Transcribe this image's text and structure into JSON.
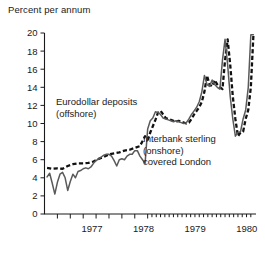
{
  "chart_data": {
    "type": "line",
    "title": "Percent per annum",
    "xlabel": "",
    "ylabel": "Percent per annum",
    "ylim": [
      0,
      20
    ],
    "ytick_step": 2,
    "yticks": [
      0,
      2,
      4,
      6,
      8,
      10,
      12,
      14,
      16,
      18,
      20
    ],
    "xlim": [
      1976.5,
      1980.6
    ],
    "xticks": [
      1977,
      1978,
      1979,
      1980
    ],
    "xtick_labels": [
      "1977",
      "1978",
      "1979",
      "1980"
    ],
    "grid": false,
    "legend_position": "inline-annotations",
    "annotations": [
      {
        "name": "eurodollar-annotation",
        "lines": [
          "Eurodollar deposits",
          "(offshore)"
        ],
        "x": 56,
        "y": 105
      },
      {
        "name": "interbank-annotation",
        "lines": [
          "Interbank sterling",
          "(onshore)",
          "covered London"
        ],
        "x": 143,
        "y": 142
      }
    ],
    "series": [
      {
        "name": "Eurodollar deposits (offshore)",
        "style": "dashed",
        "color": "#111111",
        "x": [
          1976.55,
          1976.65,
          1976.75,
          1976.85,
          1976.95,
          1977.05,
          1977.15,
          1977.25,
          1977.35,
          1977.45,
          1977.55,
          1977.65,
          1977.75,
          1977.85,
          1977.95,
          1978.05,
          1978.15,
          1978.25,
          1978.35,
          1978.45,
          1978.5,
          1978.55,
          1978.6,
          1978.65,
          1978.7,
          1978.75,
          1978.8,
          1978.85,
          1978.9,
          1978.95,
          1979.0,
          1979.05,
          1979.1,
          1979.15,
          1979.2,
          1979.25,
          1979.3,
          1979.35,
          1979.4,
          1979.45,
          1979.5,
          1979.55,
          1979.6,
          1979.65,
          1979.7,
          1979.75,
          1979.8,
          1979.85,
          1979.9,
          1979.95,
          1980.0,
          1980.05,
          1980.1,
          1980.15,
          1980.2,
          1980.25,
          1980.3,
          1980.35,
          1980.4,
          1980.45,
          1980.5,
          1980.55
        ],
        "values": [
          5.1,
          5.0,
          5.05,
          5.0,
          5.3,
          5.5,
          5.6,
          5.6,
          5.65,
          5.8,
          6.1,
          6.3,
          6.6,
          6.7,
          6.8,
          7.0,
          7.1,
          7.3,
          7.5,
          8.6,
          8.2,
          9.0,
          9.7,
          10.4,
          11.2,
          11.4,
          11.0,
          10.6,
          10.5,
          10.4,
          10.3,
          10.2,
          10.3,
          10.2,
          10.1,
          10.0,
          10.1,
          10.5,
          11.0,
          11.4,
          11.8,
          12.4,
          13.5,
          15.3,
          14.3,
          14.1,
          14.8,
          14.3,
          14.0,
          13.8,
          17.0,
          19.3,
          16.5,
          13.0,
          10.5,
          8.6,
          9.0,
          9.1,
          10.5,
          11.5,
          14.0,
          19.8
        ]
      },
      {
        "name": "Interbank sterling (onshore) covered London",
        "style": "solid",
        "color": "#5a5a5a",
        "x": [
          1976.55,
          1976.6,
          1976.65,
          1976.7,
          1976.75,
          1976.8,
          1976.85,
          1976.9,
          1976.95,
          1977.0,
          1977.05,
          1977.1,
          1977.15,
          1977.2,
          1977.25,
          1977.3,
          1977.35,
          1977.4,
          1977.45,
          1977.5,
          1977.55,
          1977.6,
          1977.65,
          1977.7,
          1977.75,
          1977.8,
          1977.85,
          1977.9,
          1977.95,
          1978.0,
          1978.05,
          1978.1,
          1978.15,
          1978.2,
          1978.25,
          1978.3,
          1978.35,
          1978.4,
          1978.45,
          1978.5,
          1978.55,
          1978.6,
          1978.65,
          1978.7,
          1978.75,
          1978.8,
          1978.85,
          1978.9,
          1978.95,
          1979.0,
          1979.05,
          1979.1,
          1979.15,
          1979.2,
          1979.25,
          1979.3,
          1979.35,
          1979.4,
          1979.45,
          1979.5,
          1979.55,
          1979.6,
          1979.65,
          1979.7,
          1979.75,
          1979.8,
          1979.85,
          1979.9,
          1979.95,
          1980.0,
          1980.05,
          1980.1,
          1980.15,
          1980.2,
          1980.25,
          1980.3,
          1980.35,
          1980.4,
          1980.45,
          1980.5,
          1980.55
        ],
        "values": [
          4.1,
          4.5,
          3.4,
          2.2,
          3.5,
          4.4,
          4.6,
          4.0,
          2.6,
          3.6,
          4.4,
          4.0,
          4.7,
          4.8,
          5.0,
          5.1,
          5.0,
          5.2,
          5.6,
          5.9,
          6.1,
          6.3,
          6.5,
          6.6,
          6.6,
          6.4,
          5.9,
          5.3,
          6.0,
          6.1,
          6.0,
          6.4,
          6.6,
          6.6,
          7.0,
          7.0,
          6.4,
          6.0,
          5.6,
          9.4,
          10.3,
          10.6,
          11.3,
          11.2,
          11.0,
          10.6,
          10.5,
          10.4,
          10.3,
          10.2,
          10.3,
          10.2,
          10.1,
          10.0,
          10.1,
          10.5,
          11.0,
          11.4,
          11.8,
          12.4,
          13.5,
          15.3,
          14.3,
          14.1,
          14.8,
          14.3,
          14.0,
          13.8,
          17.0,
          19.3,
          16.5,
          13.0,
          10.5,
          8.6,
          9.0,
          9.1,
          10.5,
          11.5,
          14.0,
          19.8,
          19.8
        ]
      }
    ]
  }
}
